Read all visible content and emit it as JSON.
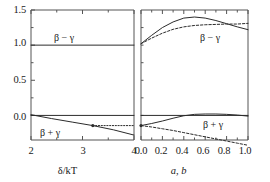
{
  "figure": {
    "panels": [
      "left",
      "right"
    ],
    "line_color": "#2b2b2b",
    "frame_color": "#555555",
    "background": "#ffffff"
  },
  "chart_data": [
    {
      "type": "line",
      "panel": "left",
      "title": "",
      "xlabel": "δ/kT",
      "ylabel": "",
      "xlim": [
        2,
        4
      ],
      "ylim": [
        -0.35,
        1.5
      ],
      "xticks": [
        "2",
        "3",
        "4"
      ],
      "xtick_values": [
        2,
        3,
        4
      ],
      "yticks": [
        "0.0",
        "0.5",
        "1.0",
        "1.5"
      ],
      "ytick_values": [
        0.0,
        0.5,
        1.0,
        1.5
      ],
      "minor_yticks": [
        0.25,
        0.75,
        1.25
      ],
      "minor_xticks": [
        2.5,
        3.5
      ],
      "grid": false,
      "legend": "inline-annotations",
      "annotations": [
        {
          "text": "β − γ",
          "x": 2.5,
          "y": 1.12
        },
        {
          "text": "β + γ",
          "x": 2.45,
          "y": -0.25
        }
      ],
      "series": [
        {
          "name": "β − γ",
          "style": "solid",
          "x": [
            2.0,
            4.0
          ],
          "values": [
            1.0,
            1.0
          ]
        },
        {
          "name": "zero-axis",
          "style": "solid",
          "x": [
            2.0,
            4.0
          ],
          "values": [
            0.0,
            0.0
          ]
        },
        {
          "name": "β + γ",
          "style": "solid",
          "x": [
            2.0,
            2.4,
            2.8,
            3.2,
            3.6,
            4.0
          ],
          "values": [
            0.01,
            -0.045,
            -0.095,
            -0.145,
            -0.205,
            -0.28
          ]
        },
        {
          "name": "matching-line",
          "style": "dotted",
          "x": [
            3.2,
            4.0
          ],
          "values": [
            -0.145,
            -0.145
          ]
        }
      ],
      "markers": [
        {
          "name": "match-point",
          "x": 3.2,
          "y": -0.145
        }
      ]
    },
    {
      "type": "line",
      "panel": "right",
      "title": "",
      "xlabel": "a, b",
      "ylabel": "",
      "xlim": [
        0.0,
        1.0
      ],
      "ylim": [
        -0.35,
        1.5
      ],
      "xticks": [
        "0.0",
        "0.2",
        "0.4",
        "0.6",
        "0.8",
        "1.0"
      ],
      "xtick_values": [
        0.0,
        0.2,
        0.4,
        0.6,
        0.8,
        1.0
      ],
      "yticks": [],
      "minor_yticks": [
        0.0,
        0.25,
        0.5,
        0.75,
        1.0,
        1.25
      ],
      "minor_xticks": [
        0.1,
        0.3,
        0.5,
        0.7,
        0.9
      ],
      "grid": false,
      "legend": "inline-annotations",
      "annotations": [
        {
          "text": "β − γ",
          "x": 0.63,
          "y": 1.16
        },
        {
          "text": "β + γ",
          "x": 0.66,
          "y": -0.17
        }
      ],
      "series": [
        {
          "name": "β − γ (a)",
          "style": "solid",
          "x": [
            0.0,
            0.1,
            0.2,
            0.3,
            0.4,
            0.5,
            0.6,
            0.7,
            0.8,
            0.9,
            1.0
          ],
          "values": [
            1.02,
            1.14,
            1.25,
            1.33,
            1.385,
            1.4,
            1.385,
            1.35,
            1.305,
            1.26,
            1.22
          ]
        },
        {
          "name": "β − γ (b)",
          "style": "dashed",
          "x": [
            0.0,
            0.1,
            0.2,
            0.3,
            0.4,
            0.5,
            0.6,
            0.7,
            0.8,
            0.9,
            1.0
          ],
          "values": [
            1.02,
            1.1,
            1.17,
            1.225,
            1.26,
            1.28,
            1.29,
            1.295,
            1.3,
            1.3,
            1.31
          ]
        },
        {
          "name": "zero-axis",
          "style": "solid",
          "x": [
            0.0,
            1.0
          ],
          "values": [
            0.0,
            0.0
          ]
        },
        {
          "name": "β + γ (a)",
          "style": "solid",
          "x": [
            0.0,
            0.1,
            0.2,
            0.3,
            0.4,
            0.5,
            0.6,
            0.7,
            0.8,
            0.9,
            1.0
          ],
          "values": [
            -0.145,
            -0.115,
            -0.08,
            -0.04,
            -0.005,
            0.015,
            0.02,
            0.02,
            0.015,
            0.005,
            -0.01
          ]
        },
        {
          "name": "β + γ (b)",
          "style": "dashed",
          "x": [
            0.0,
            0.1,
            0.2,
            0.3,
            0.4,
            0.5,
            0.6,
            0.7,
            0.8,
            0.9,
            1.0
          ],
          "values": [
            -0.145,
            -0.165,
            -0.19,
            -0.215,
            -0.245,
            -0.275,
            -0.305,
            -0.335,
            -0.365,
            -0.395,
            -0.425
          ]
        }
      ],
      "markers": [
        {
          "name": "match-point",
          "x": 0.0,
          "y": -0.145
        }
      ]
    }
  ]
}
